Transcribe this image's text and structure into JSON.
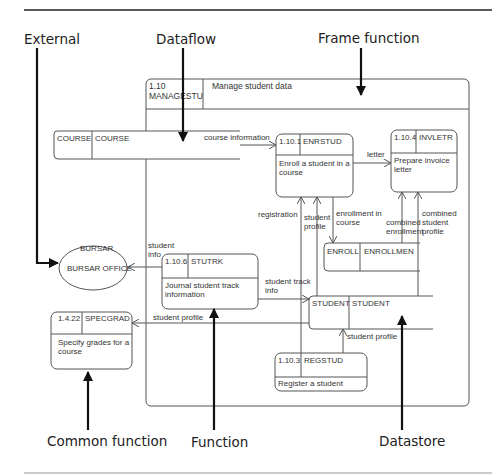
{
  "callouts": {
    "external": "External",
    "dataflow": "Dataflow",
    "frame_function": "Frame function",
    "common_function": "Common function",
    "function": "Function",
    "datastore": "Datastore"
  },
  "frame": {
    "id": "1.10",
    "code": "MANAGESTU",
    "title": "Manage student data"
  },
  "functions": [
    {
      "id": "1.10.1",
      "code": "ENRSTUD",
      "desc_line1": "Enroll a student in a",
      "desc_line2": "course"
    },
    {
      "id": "1.10.4",
      "code": "INVLETR",
      "desc_line1": "Prepare invoice",
      "desc_line2": "letter"
    },
    {
      "id": "1.10.6",
      "code": "STUTRK",
      "desc_line1": "Journal student track",
      "desc_line2": "information"
    },
    {
      "id": "1.10.3",
      "code": "REGSTUD",
      "desc_line1": "Register a student",
      "desc_line2": ""
    }
  ],
  "common_function": {
    "id": "1.4.22",
    "code": "SPECGRAD",
    "desc_line1": "Specify grades for a",
    "desc_line2": "course"
  },
  "datastores": [
    {
      "left": "COURSE",
      "right": "COURSE"
    },
    {
      "left": "ENROLL",
      "right": "ENROLLMEN"
    },
    {
      "left": "STUDENT",
      "right": "STUDENT"
    }
  ],
  "external": {
    "top": "BURSAR",
    "name": "BURSAR OFFICE"
  },
  "flows": {
    "course_information": "course information",
    "letter": "letter",
    "registration": "registration",
    "student_profile_a1": "student",
    "student_profile_a2": "profile",
    "enrollment_in_course_1": "enrollment in",
    "enrollment_in_course_2": "course",
    "combined_enrollment_1": "combined",
    "combined_enrollment_2": "enrollment",
    "combined_student_profile_1": "combined",
    "combined_student_profile_2": "student",
    "combined_student_profile_3": "profile",
    "student_info_1": "student",
    "student_info_2": "info",
    "student_track_info_1": "student track",
    "student_track_info_2": "info",
    "student_profile_b": "student profile",
    "student_profile_c": "student profile"
  }
}
